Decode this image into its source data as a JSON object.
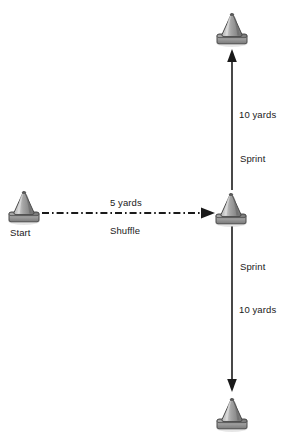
{
  "diagram": {
    "background_color": "#ffffff",
    "width": 291,
    "height": 437,
    "cone_color": "#8c8c8c",
    "line_color": "#1a1a1a",
    "text_color": "#1a1a1a"
  },
  "cones": [
    {
      "id": "top-cone",
      "name": "top-cone",
      "x": 212,
      "y": 8,
      "label": ""
    },
    {
      "id": "start-cone",
      "name": "start-cone",
      "x": 4,
      "y": 186,
      "label": "Start"
    },
    {
      "id": "middle-cone",
      "name": "middle-cone",
      "x": 211,
      "y": 188,
      "label": ""
    },
    {
      "id": "bottom-cone",
      "name": "bottom-cone",
      "x": 212,
      "y": 393,
      "label": ""
    }
  ],
  "labels": {
    "start": "Start",
    "top_distance": "10 yards",
    "top_action": "Sprint",
    "bottom_action": "Sprint",
    "bottom_distance": "10 yards",
    "shuffle_distance": "5 yards",
    "shuffle_action": "Shuffle"
  },
  "paths": [
    {
      "name": "shuffle-path",
      "from": "start-cone",
      "to": "middle-cone",
      "direction": "right",
      "style": "dash-dot",
      "distance": "5 yards",
      "action": "Shuffle"
    },
    {
      "name": "sprint-up-path",
      "from": "middle-cone",
      "to": "top-cone",
      "direction": "up",
      "style": "solid",
      "distance": "10 yards",
      "action": "Sprint"
    },
    {
      "name": "sprint-down-path",
      "from": "middle-cone",
      "to": "bottom-cone",
      "direction": "down",
      "style": "solid",
      "distance": "10 yards",
      "action": "Sprint"
    }
  ]
}
